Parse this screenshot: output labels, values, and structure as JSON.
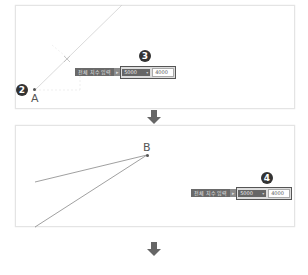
{
  "step1": {
    "badge_left": "2",
    "badge_toolbar": "3",
    "point_label": "A",
    "toolbar": {
      "label": "전체 치수 입력",
      "separator_glyph": "▸",
      "dropdown_value": "5000",
      "dropdown_chevron": "▾",
      "input_value": "4000"
    }
  },
  "step2": {
    "badge_toolbar": "4",
    "point_label": "B",
    "toolbar": {
      "label": "전체 치수 입력",
      "separator_glyph": "▸",
      "dropdown_value": "5000",
      "dropdown_chevron": "▾",
      "input_value": "4000"
    }
  },
  "arrows": [
    "arrow-down-icon",
    "arrow-down-icon"
  ],
  "colors": {
    "arrow": "#666666",
    "line": "#888888",
    "badge": "#333333",
    "toolbar_dark": "#666666"
  }
}
